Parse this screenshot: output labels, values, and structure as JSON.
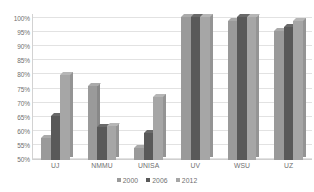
{
  "chart_data": {
    "type": "bar",
    "title": "",
    "xlabel": "",
    "ylabel": "",
    "categories": [
      "UJ",
      "NMMU",
      "UNISA",
      "UV",
      "WSU",
      "UZ"
    ],
    "series": [
      {
        "name": "2000",
        "color": "#9a9a9a",
        "values": [
          57,
          75.5,
          53.5,
          100,
          98.5,
          95
        ]
      },
      {
        "name": "2006",
        "color": "#595959",
        "values": [
          65,
          61,
          59,
          100,
          100,
          96.5
        ]
      },
      {
        "name": "2012",
        "color": "#a6a6a6",
        "values": [
          79.5,
          61.5,
          71.5,
          100,
          100,
          98.5
        ]
      }
    ],
    "ylim": [
      50,
      100
    ],
    "ytick_labels": [
      "100%",
      "95%",
      "90%",
      "85%",
      "80%",
      "75%",
      "70%",
      "65%",
      "60%",
      "55%",
      "50%"
    ],
    "ytick_values": [
      100,
      95,
      90,
      85,
      80,
      75,
      70,
      65,
      60,
      55,
      50
    ],
    "grid": true,
    "legend_position": "bottom",
    "style": "3d-clustered-column",
    "axis_color": "#d2d2d2",
    "grid_color": "#e2e2e2",
    "label_color": "#6f6f6f"
  }
}
